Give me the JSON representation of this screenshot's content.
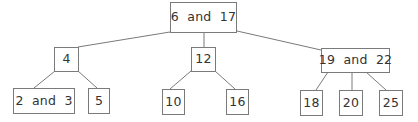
{
  "diagram": {
    "type": "tree",
    "colors": {
      "border": "#7a7a7a",
      "edge": "#7a7a7a",
      "text": "#333333",
      "background": "#ffffff"
    },
    "nodes": {
      "root": {
        "label": "6  and  17"
      },
      "n4": {
        "label": "4"
      },
      "n12": {
        "label": "12"
      },
      "n19_22": {
        "label": "19  and  22"
      },
      "n2_3": {
        "label": "2  and  3"
      },
      "n5": {
        "label": "5"
      },
      "n10": {
        "label": "10"
      },
      "n16": {
        "label": "16"
      },
      "n18": {
        "label": "18"
      },
      "n20": {
        "label": "20"
      },
      "n25": {
        "label": "25"
      }
    },
    "edges": [
      [
        "root",
        "n4"
      ],
      [
        "root",
        "n12"
      ],
      [
        "root",
        "n19_22"
      ],
      [
        "n4",
        "n2_3"
      ],
      [
        "n4",
        "n5"
      ],
      [
        "n12",
        "n10"
      ],
      [
        "n12",
        "n16"
      ],
      [
        "n19_22",
        "n18"
      ],
      [
        "n19_22",
        "n20"
      ],
      [
        "n19_22",
        "n25"
      ]
    ]
  }
}
